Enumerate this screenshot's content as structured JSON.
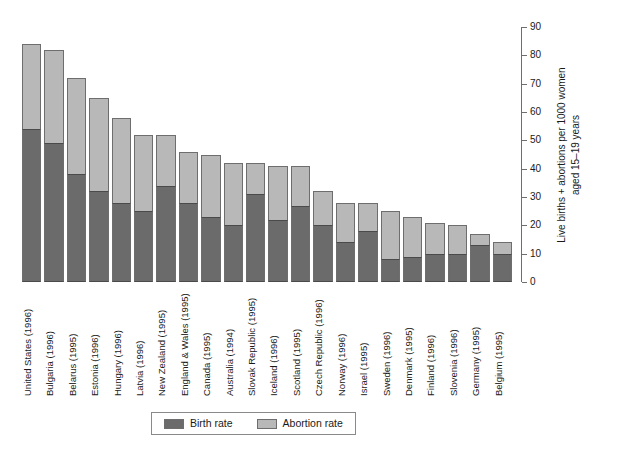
{
  "chart_data": {
    "type": "bar",
    "subtype": "stacked-bar",
    "title": "",
    "xlabel": "",
    "ylabel": "Live births + abortions per 1000 women aged 15–19 years",
    "ylabel_line1": "Live births + abortions per 1000 women",
    "ylabel_line2": "aged 15–19 years",
    "ylim": [
      0,
      90
    ],
    "ytick_step": 10,
    "yticks": [
      0,
      10,
      20,
      30,
      40,
      50,
      60,
      70,
      80,
      90
    ],
    "ytick_labels": [
      "0",
      "10",
      "20",
      "30",
      "40",
      "50",
      "60",
      "70",
      "80",
      "90"
    ],
    "axis_position": "right",
    "grid": false,
    "legend_position": "bottom-center",
    "categories": [
      "United States (1996)",
      "Bulgaria (1996)",
      "Belarus (1995)",
      "Estonia (1996)",
      "Hungary (1996)",
      "Latvia (1996)",
      "New Zealand (1995)",
      "England & Wales (1995)",
      "Canada (1995)",
      "Australia (1994)",
      "Slovak Republic (1995)",
      "Iceland (1996)",
      "Scotland (1995)",
      "Czech Republic (1996)",
      "Norway (1996)",
      "Israel (1995)",
      "Sweden (1996)",
      "Denmark (1995)",
      "Finland (1996)",
      "Slovenia (1996)",
      "Germany (1995)",
      "Belgium (1995)"
    ],
    "series": [
      {
        "name": "Birth rate",
        "color": "#6b6b6b",
        "values": [
          54,
          49,
          38,
          32,
          28,
          25,
          34,
          28,
          23,
          20,
          31,
          22,
          27,
          20,
          14,
          18,
          8,
          9,
          10,
          10,
          13,
          10
        ]
      },
      {
        "name": "Abortion rate",
        "color": "#b8b8b8",
        "values": [
          30,
          33,
          34,
          33,
          30,
          27,
          18,
          18,
          22,
          22,
          11,
          19,
          14,
          12,
          14,
          10,
          17,
          14,
          11,
          10,
          4,
          4
        ]
      }
    ],
    "totals": [
      84,
      82,
      72,
      65,
      58,
      52,
      52,
      46,
      45,
      42,
      42,
      41,
      41,
      32,
      28,
      28,
      25,
      23,
      21,
      20,
      17,
      14
    ],
    "legend": [
      {
        "label": "Birth rate",
        "color": "#6b6b6b",
        "swatch": "birth"
      },
      {
        "label": "Abortion rate",
        "color": "#b8b8b8",
        "swatch": "abortion"
      }
    ]
  }
}
